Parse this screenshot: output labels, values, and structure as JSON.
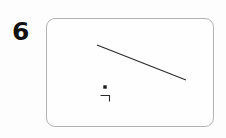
{
  "figure": {
    "label": "6",
    "background_color": "#fdfdfd",
    "width": 226,
    "height": 138
  },
  "panel": {
    "name": "diagram-panel",
    "border_color": "#b3b3b3",
    "fill_color": "#fefefe",
    "corner_radius": 9,
    "x": 46,
    "y": 18,
    "width": 168,
    "height": 109
  },
  "shapes": {
    "diagonal_line": {
      "name": "diagonal-line",
      "color": "#2a2a2a",
      "stroke_width": 1.1,
      "x1": 97,
      "y1": 45,
      "x2": 186,
      "y2": 80
    },
    "square_dot": {
      "name": "point-marker",
      "color": "#1a1a1a",
      "cx": 105,
      "cy": 87,
      "size": 3.4
    },
    "corner_mark": {
      "name": "right-angle-mark",
      "color": "#2a2a2a",
      "stroke_width": 1.1,
      "points": "100.5,95.5 109.5,95.5 109.5,101.5"
    }
  }
}
